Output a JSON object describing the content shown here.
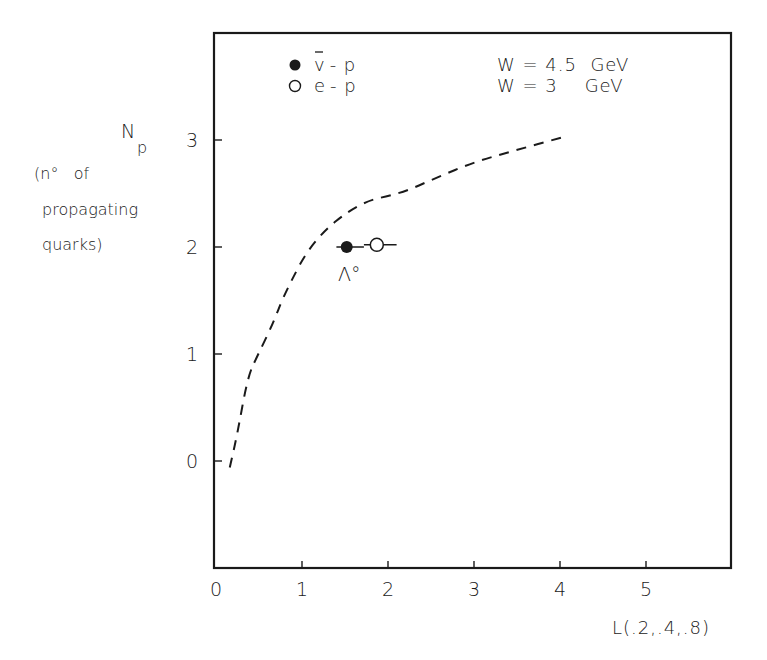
{
  "chart_data": {
    "type": "line",
    "title": "",
    "xlabel": "L(.2,.4,.8)",
    "ylabel": "N_p (n° of propagating quarks)",
    "ylabel_lines": [
      "N",
      "p",
      "(n°   of",
      "propagating",
      "quarks)"
    ],
    "xlim": [
      0,
      6
    ],
    "ylim": [
      -1,
      4
    ],
    "x_ticks": [
      "0",
      "1",
      "2",
      "3",
      "4",
      "5"
    ],
    "y_ticks": [
      "0",
      "1",
      "2",
      "3"
    ],
    "grid": false,
    "legend_position": "top-left inside",
    "legend": [
      {
        "marker": "filled-circle",
        "label": "ν̄-p",
        "label_main": "v",
        "label_rest": "- p",
        "condition": "W = 4.5  GeV"
      },
      {
        "marker": "open-circle",
        "label": "e-p",
        "label_main": "e",
        "label_rest": "- p",
        "condition": "W = 3    GeV"
      }
    ],
    "series": [
      {
        "name": "model curve",
        "style": "dashed",
        "x": [
          0.16,
          0.24,
          0.37,
          0.48,
          0.66,
          0.8,
          1.13,
          1.67,
          2.15,
          2.57,
          2.99,
          3.42,
          4.05
        ],
        "y": [
          -0.06,
          0.22,
          0.79,
          0.98,
          1.28,
          1.57,
          2.07,
          2.42,
          2.5,
          2.65,
          2.79,
          2.89,
          3.03
        ]
      },
      {
        "name": "ν̄-p (W = 4.5 GeV)",
        "style": "filled-circle",
        "x": [
          1.52
        ],
        "y": [
          2.0
        ],
        "xerr": [
          [
            1.4,
            1.72
          ]
        ]
      },
      {
        "name": "e-p (W = 3 GeV)",
        "style": "open-circle",
        "x": [
          1.87
        ],
        "y": [
          2.02
        ],
        "xerr": [
          [
            1.72,
            2.1
          ]
        ]
      }
    ],
    "annotations": [
      {
        "text": "Λ°",
        "x": 1.52,
        "y": 1.6
      }
    ]
  }
}
